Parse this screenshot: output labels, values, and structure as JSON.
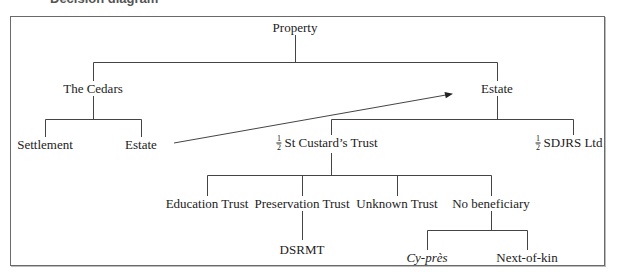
{
  "heading": {
    "text": "Decision diagram"
  },
  "diagram": {
    "root": {
      "label": "Property"
    },
    "level1": {
      "left": {
        "label": "The Cedars"
      },
      "right": {
        "label": "Estate"
      }
    },
    "cedars_children": {
      "settlement": {
        "label": "Settlement"
      },
      "estate": {
        "label": "Estate"
      }
    },
    "estate_children": {
      "st_custards": {
        "fraction_num": "1",
        "fraction_den": "2",
        "label": "St Custard’s Trust"
      },
      "sdjrs": {
        "fraction_num": "1",
        "fraction_den": "2",
        "label": "SDJRS Ltd"
      }
    },
    "trust_children": {
      "education": {
        "label": "Education Trust"
      },
      "preservation": {
        "label": "Preservation Trust"
      },
      "unknown": {
        "label": "Unknown Trust"
      },
      "no_beneficiary": {
        "label": "No beneficiary"
      }
    },
    "preservation_children": {
      "dsrmt": {
        "label": "DSRMT"
      }
    },
    "no_beneficiary_children": {
      "cy_pres": {
        "label": "Cy-près"
      },
      "next_of_kin": {
        "label": "Next-of-kin"
      }
    },
    "arrow": {
      "from": "The Cedars › Estate",
      "to": "Estate"
    }
  },
  "colors": {
    "line": "#444444",
    "frame": "#6a6a6a",
    "text": "#222222"
  }
}
